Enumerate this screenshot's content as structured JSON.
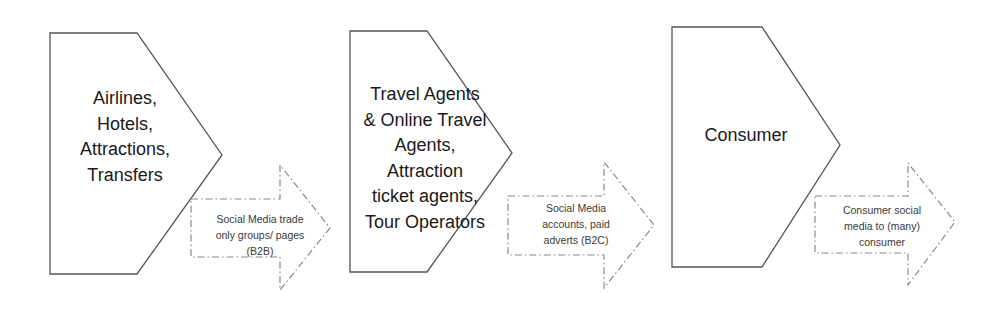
{
  "diagram": {
    "style": {
      "shape_stroke": "#555555",
      "arrow_stroke": "#8a8a8a",
      "stage_text_color": "#1a1a1a",
      "flow_text_color": "#3a3a3a",
      "background": "#ffffff"
    },
    "stages": [
      {
        "id": "suppliers",
        "name": "stage-suppliers",
        "text": "Airlines,\nHotels,\nAttractions,\nTransfers",
        "lines": [
          "Airlines,",
          "Hotels,",
          "Attractions,",
          "Transfers"
        ],
        "shape": "chevron-pentagon"
      },
      {
        "id": "intermediaries",
        "name": "stage-intermediaries",
        "text": "Travel Agents\n& Online Travel\nAgents,\nAttraction\nticket agents,\nTour Operators",
        "lines": [
          "Travel Agents",
          "& Online Travel",
          "Agents,",
          "Attraction",
          "ticket agents,",
          "Tour Operators"
        ],
        "shape": "chevron-pentagon"
      },
      {
        "id": "consumer",
        "name": "stage-consumer",
        "text": "Consumer",
        "lines": [
          "Consumer"
        ],
        "shape": "chevron-pentagon"
      }
    ],
    "flows": [
      {
        "id": "b2b",
        "name": "flow-b2b",
        "text": "Social Media trade\nonly groups/ pages\n(B2B)",
        "lines": [
          "Social Media trade",
          "only groups/ pages",
          "(B2B)"
        ],
        "shape": "dashed-arrow-right"
      },
      {
        "id": "b2c",
        "name": "flow-b2c",
        "text": "Social Media\naccounts, paid\nadverts (B2C)",
        "lines": [
          "Social Media",
          "accounts, paid",
          "adverts (B2C)"
        ],
        "shape": "dashed-arrow-right"
      },
      {
        "id": "c2c",
        "name": "flow-c2c",
        "text": "Consumer social\nmedia to (many)\nconsumer",
        "lines": [
          "Consumer social",
          "media to (many)",
          "consumer"
        ],
        "shape": "dashed-arrow-right"
      }
    ]
  }
}
